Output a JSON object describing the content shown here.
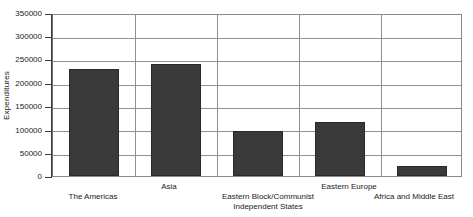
{
  "chart_data": {
    "type": "bar",
    "title": "",
    "xlabel": "",
    "ylabel": "Expenditures",
    "categories": [
      "The Americas",
      "Asia",
      "Eastern Block/Communist\nIndependent States",
      "Eastern Europe",
      "Africa and Middle East"
    ],
    "values": [
      230000,
      240000,
      96000,
      115000,
      22000
    ],
    "ylim": [
      0,
      350000
    ],
    "yticks": [
      0,
      50000,
      100000,
      150000,
      200000,
      250000,
      300000,
      350000
    ],
    "ytick_labels": [
      "0",
      "50000",
      "100000",
      "150000",
      "200000",
      "250000",
      "300000",
      "350000"
    ],
    "grid": true,
    "grid_axes": "both",
    "legend": false,
    "bar_color": "#3a3a3a",
    "grid_color": "#8f8f8f",
    "axis_color": "#3d3d3d",
    "background": "#ffffff"
  }
}
